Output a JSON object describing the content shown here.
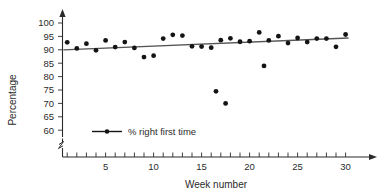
{
  "chart_data": {
    "type": "scatter",
    "title": "",
    "xlabel": "Week number",
    "ylabel": "Percentage",
    "xlim": [
      0,
      31
    ],
    "ylim": [
      58,
      102
    ],
    "y_axis_break": true,
    "grid": false,
    "legend_position": "inside-lower-left",
    "legend": [
      {
        "name": "% right first time",
        "marker": "line-with-dot"
      }
    ],
    "xticks": [
      1,
      2,
      3,
      4,
      5,
      6,
      7,
      8,
      9,
      10,
      11,
      12,
      13,
      14,
      15,
      16,
      17,
      18,
      19,
      20,
      21,
      22,
      23,
      24,
      25,
      26,
      27,
      28,
      29,
      30
    ],
    "xtick_labels": [
      {
        "value": 5,
        "label": "5"
      },
      {
        "value": 10,
        "label": "10"
      },
      {
        "value": 15,
        "label": "15"
      },
      {
        "value": 20,
        "label": "20"
      },
      {
        "value": 25,
        "label": "25"
      },
      {
        "value": 30,
        "label": "30"
      }
    ],
    "yticks": [
      60,
      65,
      70,
      75,
      80,
      85,
      90,
      95,
      100
    ],
    "ytick_labels": [
      "60",
      "65",
      "70",
      "75",
      "80",
      "85",
      "90",
      "95",
      "100"
    ],
    "series": [
      {
        "name": "% right first time",
        "x": [
          1,
          2,
          3,
          4,
          5,
          6,
          7,
          8,
          9,
          10,
          11,
          12,
          13,
          14,
          15,
          16,
          17,
          18,
          19,
          20,
          21,
          22,
          23,
          24,
          25,
          26,
          27,
          28,
          29,
          30
        ],
        "values": [
          92.8,
          90.5,
          92.3,
          89.8,
          93.5,
          91.0,
          92.9,
          90.7,
          87.3,
          87.8,
          94.2,
          95.6,
          95.3,
          91.3,
          91.2,
          90.8,
          93.6,
          94.3,
          93.0,
          93.2,
          96.5,
          93.5,
          95.1,
          92.5,
          94.4,
          92.9,
          94.2,
          94.2,
          91.1,
          95.7
        ]
      },
      {
        "name": "outliers",
        "x": [
          16.5,
          17.5,
          21.5
        ],
        "values": [
          74.5,
          70.0,
          84.0
        ]
      }
    ],
    "trendline": {
      "name": "linear fit",
      "x_start": 0.6,
      "y_start": 90.0,
      "x_end": 30.3,
      "y_end": 94.4
    }
  },
  "axis": {
    "y_title": "Percentage",
    "x_title": "Week number"
  },
  "legend_entry": {
    "label": "% right first time"
  }
}
